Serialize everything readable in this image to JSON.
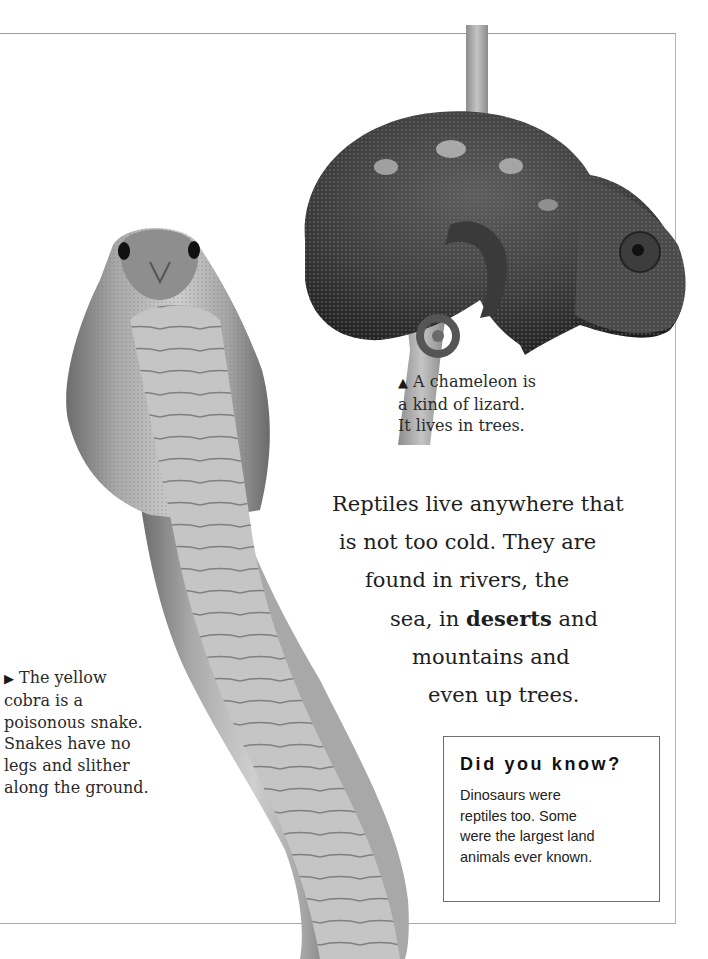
{
  "page": {
    "frame_color": "#9a9a9a"
  },
  "images": {
    "chameleon": {
      "subject": "chameleon on a branch",
      "icon": "chameleon-photo"
    },
    "cobra": {
      "subject": "yellow cobra with hood raised",
      "icon": "cobra-photo"
    }
  },
  "captions": {
    "chameleon": {
      "marker": "▲",
      "lines": [
        "A chameleon is",
        "a kind of lizard.",
        "It lives in trees."
      ]
    },
    "cobra": {
      "marker": "▶",
      "lines": [
        "The yellow",
        "cobra is a",
        "poisonous snake.",
        "Snakes have no",
        "legs and slither",
        "along the ground."
      ]
    }
  },
  "main_text": {
    "lines": [
      {
        "text": "Reptiles live anywhere that"
      },
      {
        "text": "is not too cold. They are"
      },
      {
        "text": "found in rivers, the"
      },
      {
        "before": "sea, in ",
        "bold": "deserts",
        "after": " and"
      },
      {
        "text": "mountains and"
      },
      {
        "text": "even up trees."
      }
    ]
  },
  "did_you_know": {
    "title": "Did you know?",
    "lines": [
      "Dinosaurs were",
      "reptiles too. Some",
      "were the largest land",
      "animals ever known."
    ]
  }
}
